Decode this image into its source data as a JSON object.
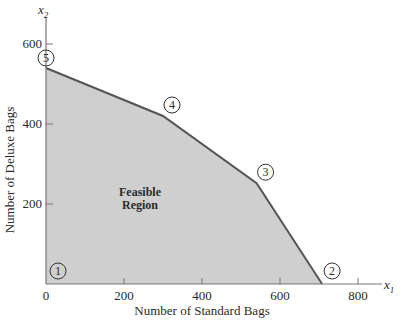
{
  "chart_data": {
    "type": "area",
    "title": "",
    "xlabel": "Number of Standard Bags",
    "ylabel": "Number of Deluxe Bags",
    "x_axis_var": "x",
    "x_axis_sub": "1",
    "y_axis_var": "x",
    "y_axis_sub": "2",
    "xlim": [
      0,
      900
    ],
    "ylim": [
      0,
      660
    ],
    "x_ticks": [
      0,
      200,
      400,
      600,
      800
    ],
    "x_tick_labels": [
      "0",
      "200",
      "400",
      "600",
      "800"
    ],
    "y_ticks": [
      200,
      400,
      600
    ],
    "y_tick_labels": [
      "200",
      "400",
      "600"
    ],
    "grid": false,
    "region": {
      "label_line1": "Feasible",
      "label_line2": "Region",
      "fill_color": "#cfcfcf",
      "edge_color": "#555555"
    },
    "vertices": [
      {
        "id": "1",
        "x": 0,
        "y": 0
      },
      {
        "id": "2",
        "x": 708,
        "y": 0
      },
      {
        "id": "3",
        "x": 540,
        "y": 252
      },
      {
        "id": "4",
        "x": 300,
        "y": 420
      },
      {
        "id": "5",
        "x": 0,
        "y": 540
      }
    ]
  }
}
